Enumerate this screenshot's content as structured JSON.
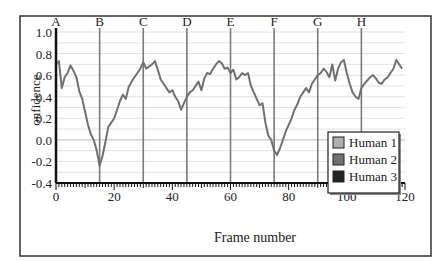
{
  "chart_data": {
    "type": "line",
    "title": "",
    "xlabel": "Frame number",
    "ylabel": "onfidence",
    "xlim": [
      0,
      120
    ],
    "ylim": [
      -0.4,
      1.0
    ],
    "x_ticks": [
      0,
      20,
      40,
      60,
      80,
      100,
      120
    ],
    "y_ticks": [
      1.0,
      0.8,
      0.6,
      0.4,
      0.2,
      0.0,
      -0.2,
      -0.4
    ],
    "y_tick_labels": [
      "1.0",
      "0.8",
      "0.6",
      "0.4",
      "0.2",
      "0.0",
      "-0.2",
      "-0.4"
    ],
    "grid": true,
    "legend_position": "right-center",
    "legend": [
      "Human 1",
      "Human 2",
      "Human 3"
    ],
    "legend_colors": [
      "#b0b0b0",
      "#707070",
      "#222222"
    ],
    "markers": [
      {
        "label": "A",
        "x": 0
      },
      {
        "label": "B",
        "x": 15
      },
      {
        "label": "C",
        "x": 30
      },
      {
        "label": "D",
        "x": 45
      },
      {
        "label": "E",
        "x": 60
      },
      {
        "label": "F",
        "x": 75
      },
      {
        "label": "G",
        "x": 90
      },
      {
        "label": "H",
        "x": 105
      }
    ],
    "series": [
      {
        "name": "confidence",
        "color": "#707070",
        "x": [
          0,
          1,
          2,
          3,
          4,
          5,
          6,
          7,
          8,
          9,
          10,
          11,
          12,
          13,
          14,
          15,
          16,
          17,
          18,
          19,
          20,
          21,
          22,
          23,
          24,
          25,
          26,
          27,
          28,
          29,
          30,
          31,
          32,
          33,
          34,
          35,
          36,
          37,
          38,
          39,
          40,
          41,
          42,
          43,
          44,
          45,
          46,
          47,
          48,
          49,
          50,
          51,
          52,
          53,
          54,
          55,
          56,
          57,
          58,
          59,
          60,
          61,
          62,
          63,
          64,
          65,
          66,
          67,
          68,
          69,
          70,
          71,
          72,
          73,
          74,
          75,
          76,
          77,
          78,
          79,
          80,
          81,
          82,
          83,
          84,
          85,
          86,
          87,
          88,
          89,
          90,
          91,
          92,
          93,
          94,
          95,
          96,
          97,
          98,
          99,
          100,
          101,
          102,
          103,
          104,
          105,
          106,
          107,
          108,
          109,
          110,
          111,
          112,
          113,
          114,
          115,
          116,
          117,
          118,
          119
        ],
        "values": [
          0.7,
          0.73,
          0.48,
          0.58,
          0.62,
          0.69,
          0.64,
          0.58,
          0.45,
          0.38,
          0.26,
          0.14,
          0.05,
          0.0,
          -0.1,
          -0.24,
          -0.15,
          -0.02,
          0.12,
          0.16,
          0.2,
          0.28,
          0.36,
          0.42,
          0.38,
          0.49,
          0.54,
          0.58,
          0.62,
          0.66,
          0.72,
          0.66,
          0.68,
          0.7,
          0.73,
          0.65,
          0.56,
          0.52,
          0.48,
          0.44,
          0.46,
          0.4,
          0.36,
          0.28,
          0.34,
          0.4,
          0.44,
          0.46,
          0.5,
          0.54,
          0.46,
          0.57,
          0.62,
          0.61,
          0.66,
          0.7,
          0.73,
          0.71,
          0.66,
          0.67,
          0.62,
          0.65,
          0.56,
          0.58,
          0.62,
          0.6,
          0.62,
          0.5,
          0.44,
          0.38,
          0.32,
          0.34,
          0.16,
          0.04,
          0.0,
          -0.1,
          -0.14,
          -0.08,
          0.0,
          0.08,
          0.14,
          0.2,
          0.28,
          0.33,
          0.4,
          0.44,
          0.48,
          0.44,
          0.52,
          0.56,
          0.6,
          0.62,
          0.66,
          0.63,
          0.58,
          0.7,
          0.55,
          0.66,
          0.72,
          0.74,
          0.62,
          0.52,
          0.44,
          0.4,
          0.38,
          0.48,
          0.52,
          0.55,
          0.58,
          0.6,
          0.57,
          0.53,
          0.52,
          0.56,
          0.58,
          0.62,
          0.66,
          0.74,
          0.7,
          0.66
        ]
      }
    ]
  }
}
